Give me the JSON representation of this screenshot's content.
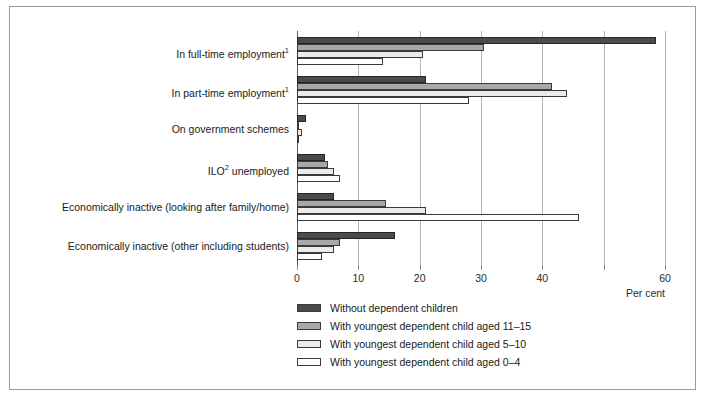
{
  "chart_data": {
    "type": "bar",
    "orientation": "horizontal",
    "title": "",
    "xlabel": "Per cent",
    "ylabel": "",
    "xlim": [
      0,
      60
    ],
    "xticks": [
      0,
      10,
      20,
      30,
      40,
      50,
      60
    ],
    "xtick_labels": [
      "0",
      "10",
      "20",
      "30",
      "40",
      "",
      "60"
    ],
    "grid": true,
    "legend_position": "bottom-left",
    "categories": [
      "In full-time employment¹",
      "In part-time employment¹",
      "On government schemes",
      "ILO² unemployed",
      "Economically inactive (looking after family/home)",
      "Economically inactive (other including students)"
    ],
    "series": [
      {
        "name": "Without dependent children",
        "color": "#4a4a4a",
        "values": [
          58.5,
          21.0,
          1.5,
          4.5,
          6.0,
          16.0
        ]
      },
      {
        "name": "With youngest dependent child aged 11–15",
        "color": "#a8a8a8",
        "values": [
          30.5,
          41.5,
          0.4,
          5.0,
          14.5,
          7.0
        ]
      },
      {
        "name": "With youngest dependent child aged 5–10",
        "color": "#ebebeb",
        "values": [
          20.5,
          44.0,
          0.8,
          6.0,
          21.0,
          6.0
        ]
      },
      {
        "name": "With youngest dependent child aged 0–4",
        "color": "#ffffff",
        "values": [
          14.0,
          28.0,
          0.3,
          7.0,
          46.0,
          4.0
        ]
      }
    ]
  },
  "axis": {
    "unit_label": "Per cent"
  },
  "legend": {
    "items": [
      {
        "label": "Without dependent children",
        "color": "#4a4a4a"
      },
      {
        "label": "With youngest dependent child aged 11–15",
        "color": "#a8a8a8"
      },
      {
        "label": "With youngest dependent child aged 5–10",
        "color": "#ebebeb"
      },
      {
        "label": "With youngest dependent child aged 0–4",
        "color": "#ffffff"
      }
    ]
  },
  "categories_html": [
    "In full-time employment<sup>1</sup>",
    "In part-time employment<sup>1</sup>",
    "On government schemes",
    "ILO<sup>2</sup> unemployed",
    "Economically inactive (looking after family/home)",
    "Economically inactive (other including students)"
  ]
}
